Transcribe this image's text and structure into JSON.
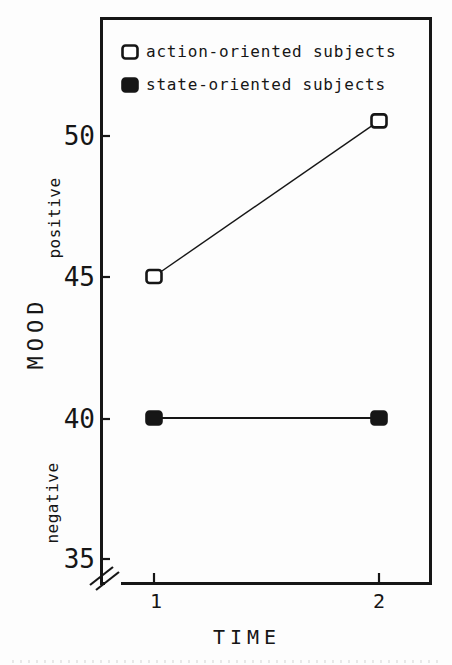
{
  "chart_data": {
    "type": "line",
    "x": [
      "1",
      "2"
    ],
    "series": [
      {
        "name": "action-oriented subjects",
        "marker": "open-square",
        "values": [
          45.0,
          50.5
        ]
      },
      {
        "name": "state-oriented subjects",
        "marker": "filled-square",
        "values": [
          40.0,
          40.0
        ]
      }
    ],
    "axes": {
      "xlabel": "TIME",
      "ylabel": "MOOD",
      "ylabel_upper": "positive",
      "ylabel_lower": "negative"
    },
    "yticks": [
      "50",
      "45",
      "40",
      "35"
    ],
    "xticks": [
      "1",
      "2"
    ],
    "ylim": [
      35,
      52
    ],
    "axis_break_below": 35,
    "grid": "off",
    "legend_position": "top-left-inside",
    "colors": {
      "ink": "#161616",
      "background": "#fdfdfd",
      "open_marker_fill": "#ffffff"
    }
  }
}
